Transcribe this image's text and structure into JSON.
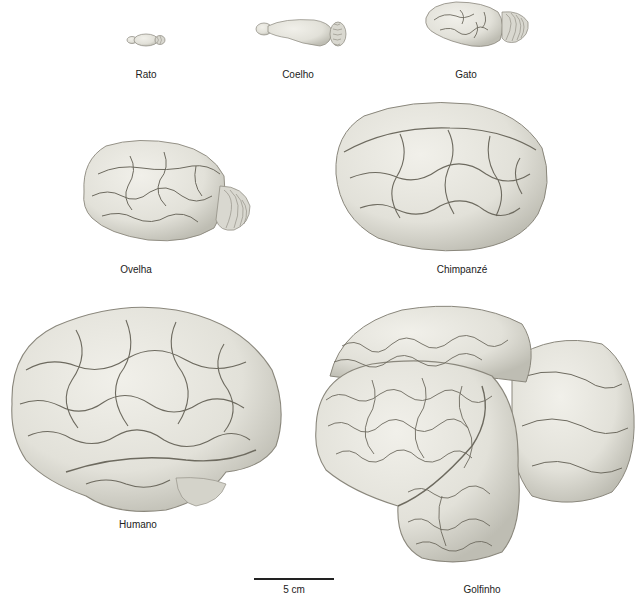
{
  "figure": {
    "type": "brain-size-comparison",
    "specimens": [
      {
        "id": "rato",
        "label": "Rato"
      },
      {
        "id": "coelho",
        "label": "Coelho"
      },
      {
        "id": "gato",
        "label": "Gato"
      },
      {
        "id": "ovelha",
        "label": "Ovelha"
      },
      {
        "id": "chimpanze",
        "label": "Chimpanzé"
      },
      {
        "id": "humano",
        "label": "Humano"
      },
      {
        "id": "golfinho",
        "label": "Golfinho"
      }
    ],
    "scale_bar": {
      "label": "5 cm"
    }
  },
  "colors": {
    "brain_fill": "#e4e3dc",
    "brain_shade": "#c9c8bf",
    "sulcus": "#6d6a5f",
    "outline": "#8a877c",
    "text": "#222222",
    "background": "#ffffff"
  }
}
